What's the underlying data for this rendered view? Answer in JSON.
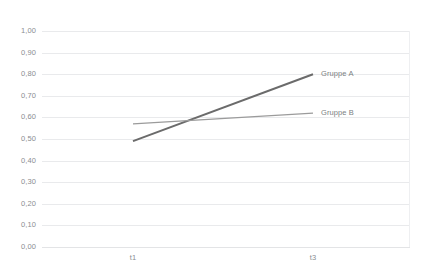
{
  "chart_data": {
    "type": "line",
    "title": "",
    "xlabel": "",
    "ylabel": "",
    "categories": [
      "t1",
      "t3"
    ],
    "ylim": [
      0.0,
      1.0
    ],
    "ytick_step": 0.1,
    "grid": true,
    "legend_position": "inline-end-of-line",
    "decimal_separator": ",",
    "series": [
      {
        "name": "Gruppe A",
        "values": [
          0.49,
          0.8
        ],
        "color": "#6b6b6b",
        "width": 2.0
      },
      {
        "name": "Gruppe B",
        "values": [
          0.57,
          0.62
        ],
        "color": "#9b9b9b",
        "width": 1.1
      }
    ],
    "ytick_labels": [
      "1,00",
      "0,90",
      "0,80",
      "0,70",
      "0,60",
      "0,50",
      "0,40",
      "0,30",
      "0,20",
      "0,10",
      "0,00"
    ],
    "ytick_values": [
      1.0,
      0.9,
      0.8,
      0.7,
      0.6,
      0.5,
      0.4,
      0.3,
      0.2,
      0.1,
      0.0
    ],
    "annotations": {
      "crossing_point": {
        "x_fraction": 0.345,
        "value": 0.565
      }
    }
  },
  "colors": {
    "background": "#ffffff",
    "gridline": "#e9eaec",
    "axis_text": "#8a8d91",
    "label_text": "#7c7f83",
    "series_a": "#6b6b6b",
    "series_b": "#9b9b9b"
  }
}
